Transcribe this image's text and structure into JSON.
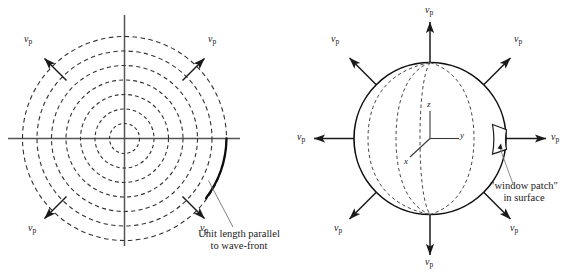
{
  "figure": {
    "type": "diagram",
    "background_color": "#ffffff",
    "line_color": "#1a1a1a",
    "axis_color": "#4a4a4a",
    "dash_color": "#333333"
  },
  "left_panel": {
    "name": "concentric-wavefronts",
    "circle_count": 7,
    "center_label": "",
    "axes": {
      "horizontal": true,
      "vertical": true
    },
    "velocity_arrows": [
      {
        "id": "up-left",
        "symbol": "v",
        "subscript": "p"
      },
      {
        "id": "up-right",
        "symbol": "v",
        "subscript": "p"
      },
      {
        "id": "low-left",
        "symbol": "v",
        "subscript": "p"
      },
      {
        "id": "low-right",
        "symbol": "v",
        "subscript": "p"
      }
    ],
    "annotation": {
      "line1": "Unit length parallel",
      "line2": "to wave-front"
    }
  },
  "right_panel": {
    "name": "spherical-wavefront",
    "meridian_count": 4,
    "axes_labels": {
      "z": "z",
      "y": "y",
      "x": "x"
    },
    "velocity_arrows": [
      {
        "id": "top",
        "symbol": "v",
        "subscript": "p"
      },
      {
        "id": "up-left",
        "symbol": "v",
        "subscript": "p"
      },
      {
        "id": "up-right",
        "symbol": "v",
        "subscript": "p"
      },
      {
        "id": "left",
        "symbol": "v",
        "subscript": "p"
      },
      {
        "id": "right",
        "symbol": "v",
        "subscript": "p"
      },
      {
        "id": "low-left",
        "symbol": "v",
        "subscript": "p"
      },
      {
        "id": "low-right",
        "symbol": "v",
        "subscript": "p"
      },
      {
        "id": "bottom",
        "symbol": "v",
        "subscript": "p"
      }
    ],
    "annotation": {
      "line1": "\"window patch\"",
      "line2": "in surface"
    }
  }
}
